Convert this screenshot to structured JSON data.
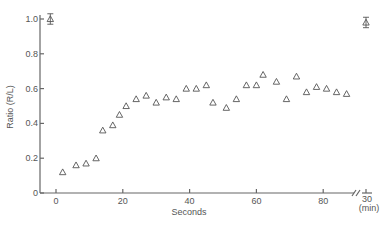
{
  "chart_data": {
    "type": "scatter",
    "title": "",
    "xlabel": "Seconds",
    "ylabel": "Ratio (R/L)",
    "xlim": [
      -5,
      92
    ],
    "ylim": [
      0,
      1.0
    ],
    "x_ticks": [
      0,
      20,
      40,
      60,
      80
    ],
    "x_tick_labels": [
      "0",
      "20",
      "40",
      "60",
      "80"
    ],
    "x_break_tick": {
      "label": "30",
      "unit_label": "(min)"
    },
    "y_ticks": [
      0,
      0.2,
      0.4,
      0.6,
      0.8,
      1.0
    ],
    "y_tick_labels": [
      "0",
      "0.2",
      "0.4",
      "0.6",
      "0.8",
      "1.0"
    ],
    "grid": false,
    "legend": null,
    "marker": "open-triangle",
    "series": [
      {
        "name": "Ratio (R/L)",
        "x": [
          2,
          6,
          9,
          12,
          14,
          17,
          19,
          21,
          24,
          27,
          30,
          33,
          36,
          39,
          42,
          45,
          47,
          51,
          54,
          57,
          60,
          62,
          66,
          69,
          72,
          75,
          78,
          81,
          84,
          87
        ],
        "values": [
          0.12,
          0.16,
          0.17,
          0.2,
          0.36,
          0.39,
          0.45,
          0.5,
          0.54,
          0.56,
          0.52,
          0.55,
          0.54,
          0.6,
          0.6,
          0.62,
          0.52,
          0.49,
          0.54,
          0.62,
          0.62,
          0.68,
          0.64,
          0.54,
          0.67,
          0.58,
          0.61,
          0.6,
          0.58,
          0.57
        ]
      }
    ],
    "reference_points": [
      {
        "label": "baseline",
        "x": -2,
        "value": 1.0,
        "error": 0.03
      },
      {
        "label": "30 min",
        "x": "30 min",
        "value": 0.98,
        "error": 0.03
      }
    ]
  }
}
